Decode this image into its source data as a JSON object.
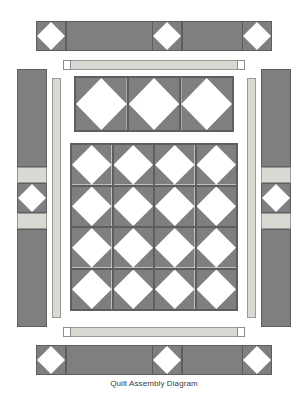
{
  "diagram": {
    "caption": "Quilt Assembly Diagram",
    "colors": {
      "fabric_dark": "#7f7f7f",
      "fabric_light": "#d9d9d4",
      "fabric_white": "#ffffff",
      "seam_line": "#5e5e5e",
      "background": "#ffffff",
      "caption_text": "#3a3a3a"
    },
    "top_border": {
      "name": "top-border-strip",
      "pinwheel_positions": [
        "left",
        "center",
        "right"
      ],
      "pinwheel_count": 3,
      "segment_count": 2
    },
    "bottom_border": {
      "name": "bottom-border-strip",
      "pinwheel_positions": [
        "left",
        "center",
        "right"
      ],
      "pinwheel_count": 3,
      "segment_count": 2
    },
    "left_border": {
      "name": "left-border-strip",
      "pinwheel_count": 1,
      "pinwheel_position": "center",
      "light_spacer_count": 2
    },
    "right_border": {
      "name": "right-border-strip",
      "pinwheel_count": 1,
      "pinwheel_position": "center",
      "light_spacer_count": 2
    },
    "top_sashing": {
      "name": "top-sashing-strip",
      "end_squares": 2
    },
    "bottom_sashing": {
      "name": "bottom-sashing-strip",
      "end_squares": 2
    },
    "left_sashing": {
      "name": "left-sashing-strip"
    },
    "right_sashing": {
      "name": "right-sashing-strip"
    },
    "upper_panel": {
      "name": "upper-block-panel",
      "columns": 3,
      "rows": 1,
      "block_count": 3
    },
    "main_panel": {
      "name": "main-block-panel",
      "columns": 4,
      "rows": 4,
      "block_count": 16
    },
    "block_type": "pinwheel",
    "unit_type": "half-square-triangle",
    "units_per_block": 4
  }
}
